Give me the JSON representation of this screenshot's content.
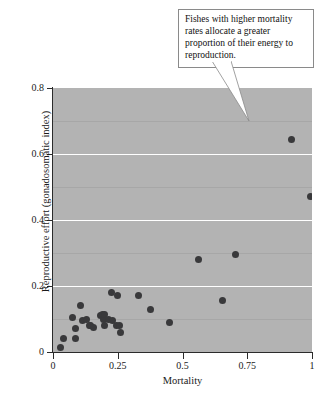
{
  "annotation": {
    "text": "Fishes with higher mortality rates allocate a greater proportion of their energy to reproduction."
  },
  "chart_data": {
    "type": "scatter",
    "title": "",
    "xlabel": "Mortality",
    "ylabel": "Reproductive effort (gonadosomatic index)",
    "xlim": [
      0,
      1
    ],
    "ylim": [
      0,
      0.8
    ],
    "xticks": [
      "0",
      "0.25",
      "0.5",
      "0.75",
      "1"
    ],
    "xtick_values": [
      0,
      0.25,
      0.5,
      0.75,
      1
    ],
    "yticks": [
      "0",
      "0.2",
      "0.4",
      "0.6",
      "0.8"
    ],
    "ytick_values": [
      0,
      0.2,
      0.4,
      0.6,
      0.8
    ],
    "grid": true,
    "gridlines_major_y": [
      0.2,
      0.4,
      0.6
    ],
    "gridlines_minor_y": [
      0.1,
      0.3,
      0.5,
      0.7
    ],
    "legend": null,
    "plot_background_color": "#b3b3b3",
    "marker_color": "#39393b",
    "points": [
      {
        "x": 0.03,
        "y": 0.015
      },
      {
        "x": 0.04,
        "y": 0.04
      },
      {
        "x": 0.085,
        "y": 0.04
      },
      {
        "x": 0.085,
        "y": 0.07
      },
      {
        "x": 0.075,
        "y": 0.105
      },
      {
        "x": 0.105,
        "y": 0.14
      },
      {
        "x": 0.115,
        "y": 0.095
      },
      {
        "x": 0.13,
        "y": 0.1
      },
      {
        "x": 0.14,
        "y": 0.08
      },
      {
        "x": 0.145,
        "y": 0.08
      },
      {
        "x": 0.155,
        "y": 0.075
      },
      {
        "x": 0.185,
        "y": 0.11
      },
      {
        "x": 0.19,
        "y": 0.115
      },
      {
        "x": 0.195,
        "y": 0.1
      },
      {
        "x": 0.2,
        "y": 0.115
      },
      {
        "x": 0.2,
        "y": 0.08
      },
      {
        "x": 0.215,
        "y": 0.1
      },
      {
        "x": 0.225,
        "y": 0.18
      },
      {
        "x": 0.23,
        "y": 0.095
      },
      {
        "x": 0.245,
        "y": 0.08
      },
      {
        "x": 0.25,
        "y": 0.17
      },
      {
        "x": 0.255,
        "y": 0.08
      },
      {
        "x": 0.26,
        "y": 0.06
      },
      {
        "x": 0.33,
        "y": 0.17
      },
      {
        "x": 0.375,
        "y": 0.13
      },
      {
        "x": 0.45,
        "y": 0.09
      },
      {
        "x": 0.56,
        "y": 0.28
      },
      {
        "x": 0.655,
        "y": 0.155
      },
      {
        "x": 0.705,
        "y": 0.295
      },
      {
        "x": 0.92,
        "y": 0.645
      },
      {
        "x": 0.995,
        "y": 0.47
      }
    ]
  }
}
